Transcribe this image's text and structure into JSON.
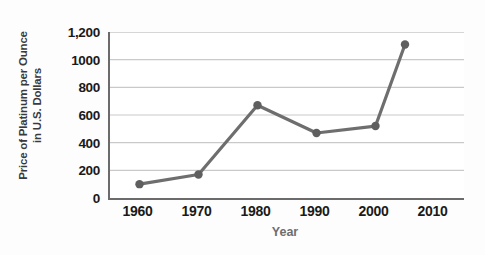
{
  "chart_data": {
    "type": "line",
    "title": "",
    "xlabel": "Year",
    "ylabel": "Price of Platinum per Ounce in U.S. Dollars",
    "ylabel_lines": [
      "Price of Platinum per Ounce",
      "in U.S. Dollars"
    ],
    "x": [
      1960,
      1970,
      1980,
      1990,
      2000,
      2005
    ],
    "values": [
      100,
      170,
      670,
      470,
      520,
      1110
    ],
    "categories": [
      "1960",
      "1970",
      "1980",
      "1990",
      "2000",
      "2005"
    ],
    "series": [
      {
        "name": "Price of Platinum per Ounce",
        "values": [
          100,
          170,
          670,
          470,
          520,
          1110
        ]
      }
    ],
    "xlim": [
      1955,
      2015
    ],
    "ylim": [
      0,
      1200
    ],
    "x_ticks": [
      1960,
      1970,
      1980,
      1990,
      2000,
      2010
    ],
    "x_tick_labels": [
      "1960",
      "1970",
      "1980",
      "1990",
      "2000",
      "2010"
    ],
    "y_ticks": [
      0,
      200,
      400,
      600,
      800,
      1000,
      1200
    ],
    "y_tick_labels": [
      "0",
      "200",
      "400",
      "600",
      "800",
      "1000",
      "1,200"
    ],
    "grid": "horizontal",
    "legend": "none",
    "marker": "circle",
    "colors": {
      "line": "#6e6e6e",
      "marker": "#5f5f5f",
      "grid": "#c9c9c9",
      "axis": "#6b6b6b",
      "tick_text": "#1a1a1a",
      "ylabel_text": "#3a3a3a",
      "xlabel_text": "#6e6e6e",
      "plot_background": "#ffffff",
      "page_background": "#fdfdfd"
    }
  }
}
